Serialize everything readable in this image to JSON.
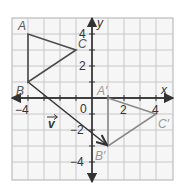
{
  "diagram": {
    "axes": {
      "x_label": "x",
      "y_label": "y",
      "origin_label": "0"
    },
    "ticks": {
      "x": [
        {
          "v": -4,
          "label": "−4"
        },
        {
          "v": 2,
          "label": "2"
        },
        {
          "v": 4,
          "label": "4"
        }
      ],
      "y": [
        {
          "v": 4,
          "label": "4"
        },
        {
          "v": 2,
          "label": "2"
        },
        {
          "v": -2,
          "label": "−2"
        },
        {
          "v": -4,
          "label": "−4"
        }
      ]
    },
    "preimage": {
      "color": "#4a4a4a",
      "points": {
        "A": [
          -4,
          4
        ],
        "B": [
          -4,
          1
        ],
        "C": [
          -1,
          3
        ]
      },
      "labels": {
        "A": "A",
        "B": "B",
        "C": "C"
      }
    },
    "image": {
      "color": "#8a8a8a",
      "points": {
        "A'": [
          1,
          0
        ],
        "B'": [
          1,
          -3
        ],
        "C'": [
          4,
          -1
        ]
      },
      "labels": {
        "A'": "A′",
        "B'": "B′",
        "C'": "C′"
      }
    },
    "vector": {
      "label": "v",
      "from": [
        -4,
        1
      ],
      "to": [
        1,
        -3
      ],
      "color": "#3a3a3a"
    },
    "grid": {
      "range": [
        -5,
        5
      ],
      "line_color": "#c8c8c8",
      "frame_color": "#aaaaaa",
      "background": "#f4f4f4"
    }
  }
}
